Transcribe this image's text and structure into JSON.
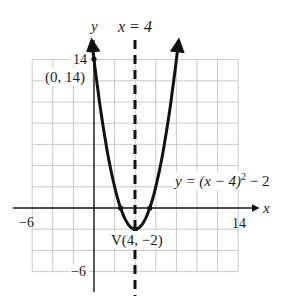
{
  "chart_data": {
    "type": "line",
    "title": "",
    "function": "y = (x - 4)^2 - 2",
    "xlabel": "x",
    "ylabel": "y",
    "xlim": [
      -6,
      14
    ],
    "ylim": [
      -6,
      14
    ],
    "grid": true,
    "grid_step": 2,
    "x_tick_labels": [
      "-6",
      "14"
    ],
    "y_tick_labels": [
      "14",
      "-6"
    ],
    "series": [
      {
        "name": "y = (x − 4)² − 2",
        "x": [
          -0.22,
          0,
          1,
          2,
          2.586,
          3,
          4,
          5,
          5.414,
          6,
          7,
          8,
          8.22
        ],
        "y": [
          15.8,
          14,
          7,
          2,
          0,
          -1,
          -2,
          -1,
          0,
          2,
          7,
          14,
          15.8
        ]
      }
    ],
    "points": [
      {
        "label": "(0, 14)",
        "x": 0,
        "y": 14
      },
      {
        "label": "V(4, −2)",
        "x": 4,
        "y": -2
      },
      {
        "label": "",
        "x": 2.586,
        "y": 0
      },
      {
        "label": "",
        "x": 5.414,
        "y": 0
      }
    ],
    "axis_of_symmetry": {
      "label": "x = 4",
      "x": 4,
      "style": "dashed"
    },
    "annotations": [
      "x = 4",
      "(0, 14)",
      "V(4, −2)",
      "y = (x − 4)² − 2"
    ]
  },
  "labels": {
    "y_axis": "y",
    "x_axis": "x",
    "axis_of_symmetry": "x = 4",
    "x_min": "−6",
    "x_max": "14",
    "y_max": "14",
    "y_min": "−6",
    "y_intercept": "(0, 14)",
    "vertex": "V(4, −2)",
    "equation_main": "y = (x − 4)",
    "equation_exp": "2",
    "equation_tail": " − 2"
  },
  "colors": {
    "grid": "#c8c8c8",
    "axis": "#1a1a1a",
    "curve": "#111111"
  }
}
